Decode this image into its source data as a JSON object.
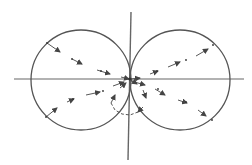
{
  "diagram": {
    "type": "vector-field-phase-portrait",
    "colors": {
      "background": "#ffffff",
      "stroke": "#555555",
      "axis": "#666666",
      "arrow": "#444444",
      "dot": "#333333"
    },
    "origin": {
      "x": 130,
      "y": 79
    },
    "axes": {
      "horizontal": {
        "x1": 14,
        "y1": 79,
        "x2": 244,
        "y2": 79
      },
      "vertical": {
        "x1": 131,
        "y1": 12,
        "x2": 128,
        "y2": 160
      }
    },
    "circles": [
      {
        "name": "left-circle",
        "cx": 81,
        "cy": 80,
        "r": 50
      },
      {
        "name": "right-circle",
        "cx": 180,
        "cy": 80,
        "r": 50
      }
    ],
    "trajectories": [
      {
        "name": "left-upper-trajectory",
        "points": [
          [
            47,
            43
          ],
          [
            60,
            52
          ],
          [
            72,
            59
          ],
          [
            82,
            64
          ],
          [
            97,
            70
          ],
          [
            110,
            74
          ],
          [
            121,
            77
          ],
          [
            129,
            79
          ]
        ],
        "direction": "inward"
      },
      {
        "name": "left-lower-trajectory",
        "points": [
          [
            46,
            117
          ],
          [
            57,
            108
          ],
          [
            67,
            102
          ],
          [
            74,
            99
          ],
          [
            86,
            95
          ],
          [
            100,
            92
          ],
          [
            113,
            86
          ],
          [
            124,
            82
          ],
          [
            129,
            80
          ]
        ],
        "direction": "inward"
      },
      {
        "name": "right-upper-trajectory",
        "points": [
          [
            131,
            79
          ],
          [
            140,
            78
          ],
          [
            150,
            74
          ],
          [
            158,
            71
          ],
          [
            168,
            67
          ],
          [
            180,
            62
          ],
          [
            196,
            56
          ],
          [
            208,
            49
          ],
          [
            212,
            45
          ]
        ],
        "direction": "outward"
      },
      {
        "name": "right-lower-trajectory",
        "points": [
          [
            131,
            81
          ],
          [
            145,
            85
          ],
          [
            155,
            89
          ],
          [
            165,
            95
          ],
          [
            178,
            100
          ],
          [
            187,
            103
          ],
          [
            198,
            110
          ],
          [
            206,
            116
          ],
          [
            211,
            119
          ]
        ],
        "direction": "outward"
      },
      {
        "name": "left-inner-loop",
        "points": [
          [
            111,
            103
          ],
          [
            115,
            95
          ],
          [
            120,
            88
          ],
          [
            126,
            83
          ],
          [
            129,
            80
          ]
        ],
        "direction": "inward"
      },
      {
        "name": "right-inner-loop",
        "points": [
          [
            131,
            80
          ],
          [
            137,
            84
          ],
          [
            143,
            90
          ],
          [
            146,
            98
          ],
          [
            143,
            107
          ],
          [
            138,
            112
          ]
        ],
        "direction": "outward"
      },
      {
        "name": "bottom-connector-arc",
        "points": [
          [
            111,
            103
          ],
          [
            115,
            110
          ],
          [
            122,
            114
          ],
          [
            130,
            115
          ],
          [
            138,
            112
          ]
        ],
        "direction": "dashed"
      }
    ],
    "dots": [
      [
        47,
        43
      ],
      [
        72,
        59
      ],
      [
        101,
        71
      ],
      [
        46,
        117
      ],
      [
        73,
        99
      ],
      [
        103,
        91
      ],
      [
        157,
        71
      ],
      [
        186,
        60
      ],
      [
        213,
        45
      ],
      [
        158,
        89
      ],
      [
        186,
        102
      ],
      [
        212,
        120
      ]
    ]
  }
}
